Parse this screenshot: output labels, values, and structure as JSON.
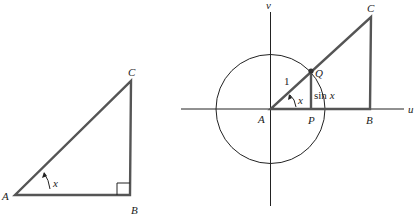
{
  "left_triangle": {
    "vertices": {
      "A": "A",
      "B": "B",
      "C": "C"
    },
    "angle_label": "x",
    "right_angle_at": "B"
  },
  "right_figure": {
    "axes": {
      "horizontal": "u",
      "vertical": "v"
    },
    "points": {
      "A": "A",
      "B": "B",
      "C": "C",
      "P": "P",
      "Q": "Q"
    },
    "radius_label": "1",
    "angle_label": "x",
    "segment_label_fn": "sin",
    "segment_label_var": "x",
    "unit_circle": true
  },
  "colors": {
    "thick_line": "#555555",
    "thin_line": "#222222",
    "text": "#222222"
  }
}
